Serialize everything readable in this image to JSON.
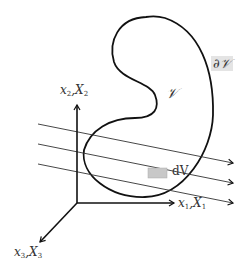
{
  "diagram": {
    "region_label": "𝒱",
    "boundary_label": "∂𝒱",
    "volume_element_label": "dV",
    "axes": [
      {
        "id": "axis-1",
        "label_lower": "x",
        "label_upper": "X",
        "index": "1"
      },
      {
        "id": "axis-2",
        "label_lower": "x",
        "label_upper": "X",
        "index": "2"
      },
      {
        "id": "axis-3",
        "label_lower": "x",
        "label_upper": "X",
        "index": "3"
      }
    ],
    "parallel_lines_count": 3,
    "colors": {
      "stroke": "#111111",
      "volume_element_fill": "#c8c8c8",
      "boundary_label_bg": "#e4e4e4"
    }
  }
}
